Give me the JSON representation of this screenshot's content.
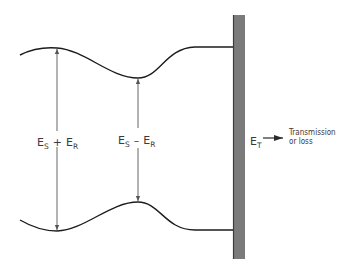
{
  "diagram": {
    "colors": {
      "line": "#1c1c1c",
      "arrow": "#555555",
      "wall_fill": "#7b7b7b",
      "wall_edge": "#3c3c3c",
      "text": "#3a3a3a",
      "background": "#ffffff"
    },
    "labels": {
      "sum": {
        "e1": "E",
        "s1": "S",
        "op": "+",
        "e2": "E",
        "s2": "R"
      },
      "difference": {
        "e1": "E",
        "s1": "S",
        "op": "–",
        "e2": "E",
        "s2": "R"
      },
      "transmitted": {
        "e": "E",
        "s": "T"
      },
      "transmission_line1": "Transmission",
      "transmission_line2": "or loss"
    },
    "elements": {
      "wall": "Boundary / wall",
      "upper_envelope": "Upper standing-wave envelope",
      "lower_envelope": "Lower standing-wave envelope",
      "max_arrow": "Maximum amplitude arrow (ES + ER)",
      "min_arrow": "Minimum amplitude arrow (ES − ER)",
      "transmission_arrow": "Transmitted energy arrow"
    }
  }
}
